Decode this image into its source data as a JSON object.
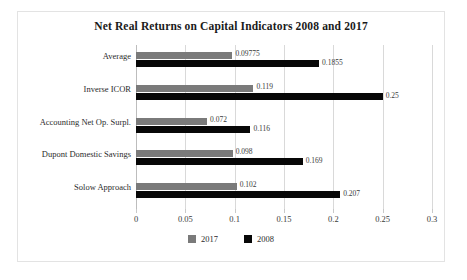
{
  "chart_data": {
    "type": "bar",
    "orientation": "horizontal",
    "title": "Net Real Returns on Capital Indicators 2008 and 2017",
    "xlabel": "",
    "ylabel": "",
    "xlim": [
      0,
      0.3
    ],
    "xticks": [
      "0",
      "0.05",
      "0.1",
      "0.15",
      "0.2",
      "0.25",
      "0.3"
    ],
    "xtick_values": [
      0,
      0.05,
      0.1,
      0.15,
      0.2,
      0.25,
      0.3
    ],
    "grid": true,
    "legend_position": "bottom-center",
    "categories": [
      "Average",
      "Inverse ICOR",
      "Accounting Net Op. Surpl.",
      "Dupont Domestic Savings",
      "Solow Approach"
    ],
    "series": [
      {
        "name": "2017",
        "color": "#7a7a7a",
        "values": [
          0.09775,
          0.119,
          0.072,
          0.098,
          0.102
        ],
        "labels": [
          "0.09775",
          "0.119",
          "0.072",
          "0.098",
          "0.102"
        ]
      },
      {
        "name": "2008",
        "color": "#070707",
        "values": [
          0.1855,
          0.25,
          0.116,
          0.169,
          0.207
        ],
        "labels": [
          "0.1855",
          "0.25",
          "0.116",
          "0.169",
          "0.207"
        ]
      }
    ]
  },
  "legend": {
    "entries": [
      {
        "label": "2017",
        "color": "#7a7a7a"
      },
      {
        "label": "2008",
        "color": "#070707"
      }
    ]
  },
  "colors": {
    "series_2017": "#7a7a7a",
    "series_2008": "#070707",
    "gridline": "#d9d9d9",
    "frame": "#e3e3e3",
    "background": "#ffffff"
  }
}
